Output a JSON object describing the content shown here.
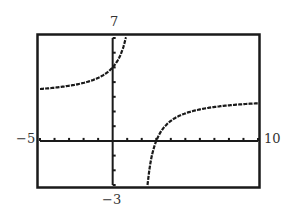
{
  "window": {
    "ymax_label": "7",
    "ymin_label": "-3",
    "xmin_label": "−5",
    "xmax_label": "10",
    "ymin_display": "−3"
  },
  "chart_data": {
    "type": "line",
    "title": "",
    "xlabel": "",
    "ylabel": "",
    "xlim": [
      -5,
      10
    ],
    "ylim": [
      -3,
      7
    ],
    "xscale": 1,
    "yscale": 1,
    "grid": false,
    "series": [
      {
        "name": "left branch",
        "x": [
          -5,
          -4,
          -3,
          -2,
          -1,
          0,
          0.5,
          0.95
        ],
        "y": [
          3.53,
          3.62,
          3.75,
          3.95,
          4.29,
          5.0,
          5.77,
          7.2
        ]
      },
      {
        "name": "right branch",
        "x": [
          2.4,
          2.6,
          3,
          4,
          5,
          6,
          7,
          8,
          9,
          10
        ],
        "y": [
          -3.0,
          -1.5,
          0,
          1.36,
          1.88,
          2.14,
          2.31,
          2.42,
          2.5,
          2.56
        ]
      }
    ],
    "colors": {
      "curve": "#1a1a1a",
      "axes": "#1a1a1a",
      "frame": "#1a1a1a"
    }
  }
}
